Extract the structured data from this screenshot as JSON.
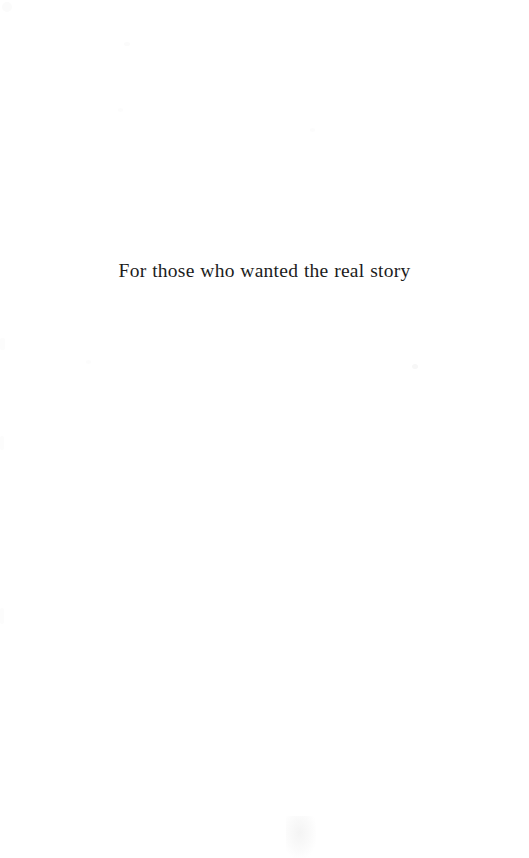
{
  "page": {
    "kind": "book-dedication-page",
    "background_color": "#ffffff",
    "text_color": "#1c1c1c",
    "width": 529,
    "height": 858
  },
  "dedication": {
    "text": "For those who wanted the real story"
  }
}
